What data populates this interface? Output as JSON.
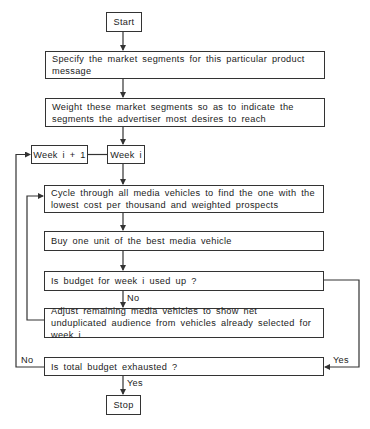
{
  "flowchart": {
    "nodes": {
      "start": {
        "label": "Start"
      },
      "specify": {
        "label": "Specify the market segments for this particular product message"
      },
      "weight": {
        "label": "Weight these market segments so as to indicate the segments the advertiser most desires to reach"
      },
      "week_next": {
        "label": "Week i + 1"
      },
      "week_current": {
        "label": "Week i"
      },
      "cycle": {
        "label": "Cycle through all media vehicles to find the one with the lowest cost per thousand and weighted prospects"
      },
      "buy": {
        "label": "Buy one unit of the best media vehicle"
      },
      "week_budget": {
        "label": "Is budget for week i used up ?"
      },
      "adjust": {
        "label": "Adjust remaining media vehicles to show net unduplicated audience from vehicles already selected for week i"
      },
      "total_budget": {
        "label": "Is total budget exhausted ?"
      },
      "stop": {
        "label": "Stop"
      }
    },
    "edge_labels": {
      "week_budget_no": "No",
      "total_budget_no": "No",
      "total_budget_yes": "Yes",
      "week_budget_yes": "Yes"
    },
    "colors": {
      "line": "#333333",
      "background": "#ffffff"
    }
  }
}
